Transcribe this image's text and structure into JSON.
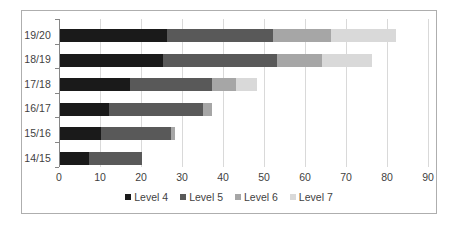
{
  "chart_data": {
    "type": "bar",
    "orientation": "horizontal",
    "stacked": true,
    "title": "",
    "xlabel": "",
    "ylabel": "",
    "categories": [
      "19/20",
      "18/19",
      "17/18",
      "16/17",
      "15/16",
      "14/15"
    ],
    "series": [
      {
        "name": "Level 4",
        "color": "#1a1a1a",
        "values": [
          26,
          25,
          17,
          12,
          10,
          7
        ]
      },
      {
        "name": "Level 5",
        "color": "#595959",
        "values": [
          26,
          28,
          20,
          23,
          17,
          13
        ]
      },
      {
        "name": "Level 6",
        "color": "#a6a6a6",
        "values": [
          14,
          11,
          6,
          2,
          1,
          0
        ]
      },
      {
        "name": "Level 7",
        "color": "#d9d9d9",
        "values": [
          16,
          12,
          5,
          0,
          0,
          0
        ]
      }
    ],
    "totals": [
      82,
      76,
      48,
      37,
      28,
      20
    ],
    "xlim": [
      0,
      90
    ],
    "xticks": [
      0,
      10,
      20,
      30,
      40,
      50,
      60,
      70,
      80,
      90
    ],
    "xtick_labels": [
      "0",
      "10",
      "20",
      "30",
      "40",
      "50",
      "60",
      "70",
      "80",
      "90"
    ],
    "grid": "vertical",
    "legend_position": "bottom",
    "legend_entries": [
      "Level 4",
      "Level 5",
      "Level 6",
      "Level 7"
    ],
    "frame_border_color": "#aeaeae",
    "gridline_color": "#d9d9d9",
    "axis_color": "#868686",
    "text_color": "#3f3f3f"
  }
}
